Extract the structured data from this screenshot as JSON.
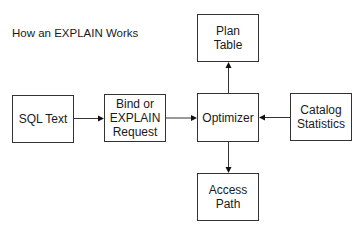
{
  "title": "How an EXPLAIN Works",
  "nodes": {
    "plan_table": "Plan\nTable",
    "sql_text": "SQL Text",
    "bind_request": "Bind or\nEXPLAIN\nRequest",
    "optimizer": "Optimizer",
    "catalog_statistics": "Catalog\nStatistics",
    "access_path": "Access\nPath"
  },
  "edges": [
    {
      "from": "SQL Text",
      "to": "Bind or EXPLAIN Request"
    },
    {
      "from": "Bind or EXPLAIN Request",
      "to": "Optimizer"
    },
    {
      "from": "Catalog Statistics",
      "to": "Optimizer"
    },
    {
      "from": "Optimizer",
      "to": "Plan Table"
    },
    {
      "from": "Optimizer",
      "to": "Access Path"
    }
  ]
}
